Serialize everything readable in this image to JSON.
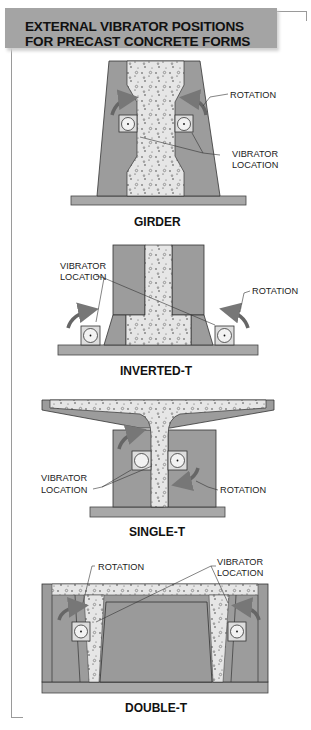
{
  "title": {
    "line1": "EXTERNAL VIBRATOR POSITIONS",
    "line2": "FOR PRECAST CONCRETE FORMS"
  },
  "colors": {
    "title_bar": "#a4a4a4",
    "form_steel": "#9c9c9c",
    "concrete": "#e6e6e6",
    "outline": "#333333"
  },
  "diagrams": [
    {
      "caption": "GIRDER",
      "labels": [
        "ROTATION",
        "VIBRATOR",
        "LOCATION"
      ]
    },
    {
      "caption": "INVERTED-T",
      "labels": [
        "VIBRATOR",
        "LOCATION",
        "ROTATION"
      ]
    },
    {
      "caption": "SINGLE-T",
      "labels": [
        "VIBRATOR",
        "LOCATION",
        "ROTATION"
      ]
    },
    {
      "caption": "DOUBLE-T",
      "labels": [
        "ROTATION",
        "VIBRATOR",
        "LOCATION"
      ]
    }
  ]
}
